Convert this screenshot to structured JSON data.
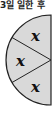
{
  "title": "3일 일한 후",
  "diagram": {
    "shape": "left half-circle divided into 3 equal sectors",
    "fill_color": "#d9d9d9",
    "stroke_color": "#222222",
    "sectors": [
      {
        "label": "x"
      },
      {
        "label": "x"
      },
      {
        "label": "x"
      }
    ]
  }
}
